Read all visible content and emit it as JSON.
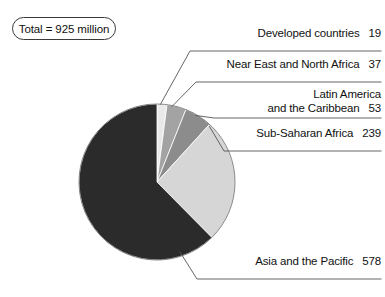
{
  "total_badge": {
    "label": "Total = 925 million"
  },
  "chart_data": {
    "type": "pie",
    "title": "",
    "total": 925,
    "units": "million",
    "start_angle_deg": 0,
    "direction": "clockwise",
    "legend_position": "callout-labels",
    "categories": [
      "Developed countries",
      "Near East and North Africa",
      "Latin America and the Caribbean",
      "Sub-Saharan Africa",
      "Asia and the Pacific"
    ],
    "values": [
      19,
      37,
      53,
      239,
      578
    ],
    "colors": [
      "#e9e9e9",
      "#a3a3a3",
      "#8c8c8c",
      "#d6d6d6",
      "#2b2b2b"
    ],
    "slices": [
      {
        "name": "Developed countries",
        "label_line1": "Developed countries",
        "label_line2": "",
        "value": 19,
        "value_text": "19",
        "color": "#e9e9e9"
      },
      {
        "name": "Near East and North Africa",
        "label_line1": "Near East and North Africa",
        "label_line2": "",
        "value": 37,
        "value_text": "37",
        "color": "#a3a3a3"
      },
      {
        "name": "Latin America and the Caribbean",
        "label_line1": "Latin America",
        "label_line2": "and the Caribbean",
        "value": 53,
        "value_text": "53",
        "color": "#8c8c8c"
      },
      {
        "name": "Sub-Saharan Africa",
        "label_line1": "Sub-Saharan Africa",
        "label_line2": "",
        "value": 239,
        "value_text": "239",
        "color": "#d6d6d6"
      },
      {
        "name": "Asia and the Pacific",
        "label_line1": "Asia and the Pacific",
        "label_line2": "",
        "value": 578,
        "value_text": "578",
        "color": "#2b2b2b"
      }
    ]
  }
}
